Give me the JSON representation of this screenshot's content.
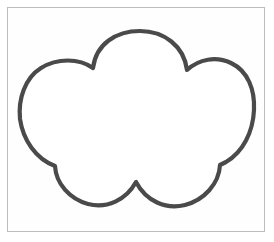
{
  "document": {
    "title": "Cloud shape outline drawing",
    "background_color": "#ffffff"
  },
  "frame": {
    "name": "image-border-frame",
    "border_color": "#bdbdbd",
    "fill_color": "#fefefe",
    "x": 7,
    "y": 7,
    "width": 258,
    "height": 225
  },
  "shape": {
    "name": "cloud",
    "kind": "outline-drawing",
    "stroke_color": "#4a4a4a",
    "fill_color": "#ffffff",
    "stroke_width": 4.2,
    "bounds": {
      "left": 20,
      "top": 31,
      "right": 254,
      "bottom": 208
    },
    "lobe_count": 4,
    "cusps": [
      {
        "name": "top-left-cusp",
        "x": 93,
        "y": 68
      },
      {
        "name": "top-right-cusp",
        "x": 187,
        "y": 70
      },
      {
        "name": "bottom-right-cusp",
        "x": 220,
        "y": 165
      },
      {
        "name": "bottom-center-cusp",
        "x": 136,
        "y": 182
      },
      {
        "name": "bottom-left-cusp",
        "x": 55,
        "y": 166
      }
    ],
    "path": "M 93 68 C 96 44 116 31 140 31 C 164 31 184 46 187 70 C 199 59 216 56 231 63 C 248 71 255 90 254 110 C 253 132 243 152 226 162 C 224 163 222 164 220 165 C 219 184 204 200 185 205 C 166 210 146 201 136 182 C 126 200 107 209 88 204 C 70 199 56 184 55 166 C 36 159 23 140 20 119 C 18 99 25 78 41 68 C 57 58 79 58 93 68 Z"
  }
}
